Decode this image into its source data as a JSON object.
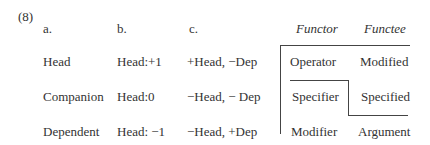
{
  "example_number": "(8)",
  "columns": {
    "a": "a.",
    "b": "b.",
    "c": "c.",
    "functor": "Functor",
    "functee": "Functee"
  },
  "rows": [
    {
      "a": "Head",
      "b": "Head:+1",
      "c": "+Head, −Dep",
      "functor": "Operator",
      "functee": "Modified"
    },
    {
      "a": "Companion",
      "b": "Head:0",
      "c": "−Head, − Dep",
      "functor": "Specifier",
      "functee": "Specified"
    },
    {
      "a": "Dependent",
      "b": "Head: −1",
      "c": "−Head, +Dep",
      "functor": "Modifier",
      "functee": "Argument"
    }
  ]
}
